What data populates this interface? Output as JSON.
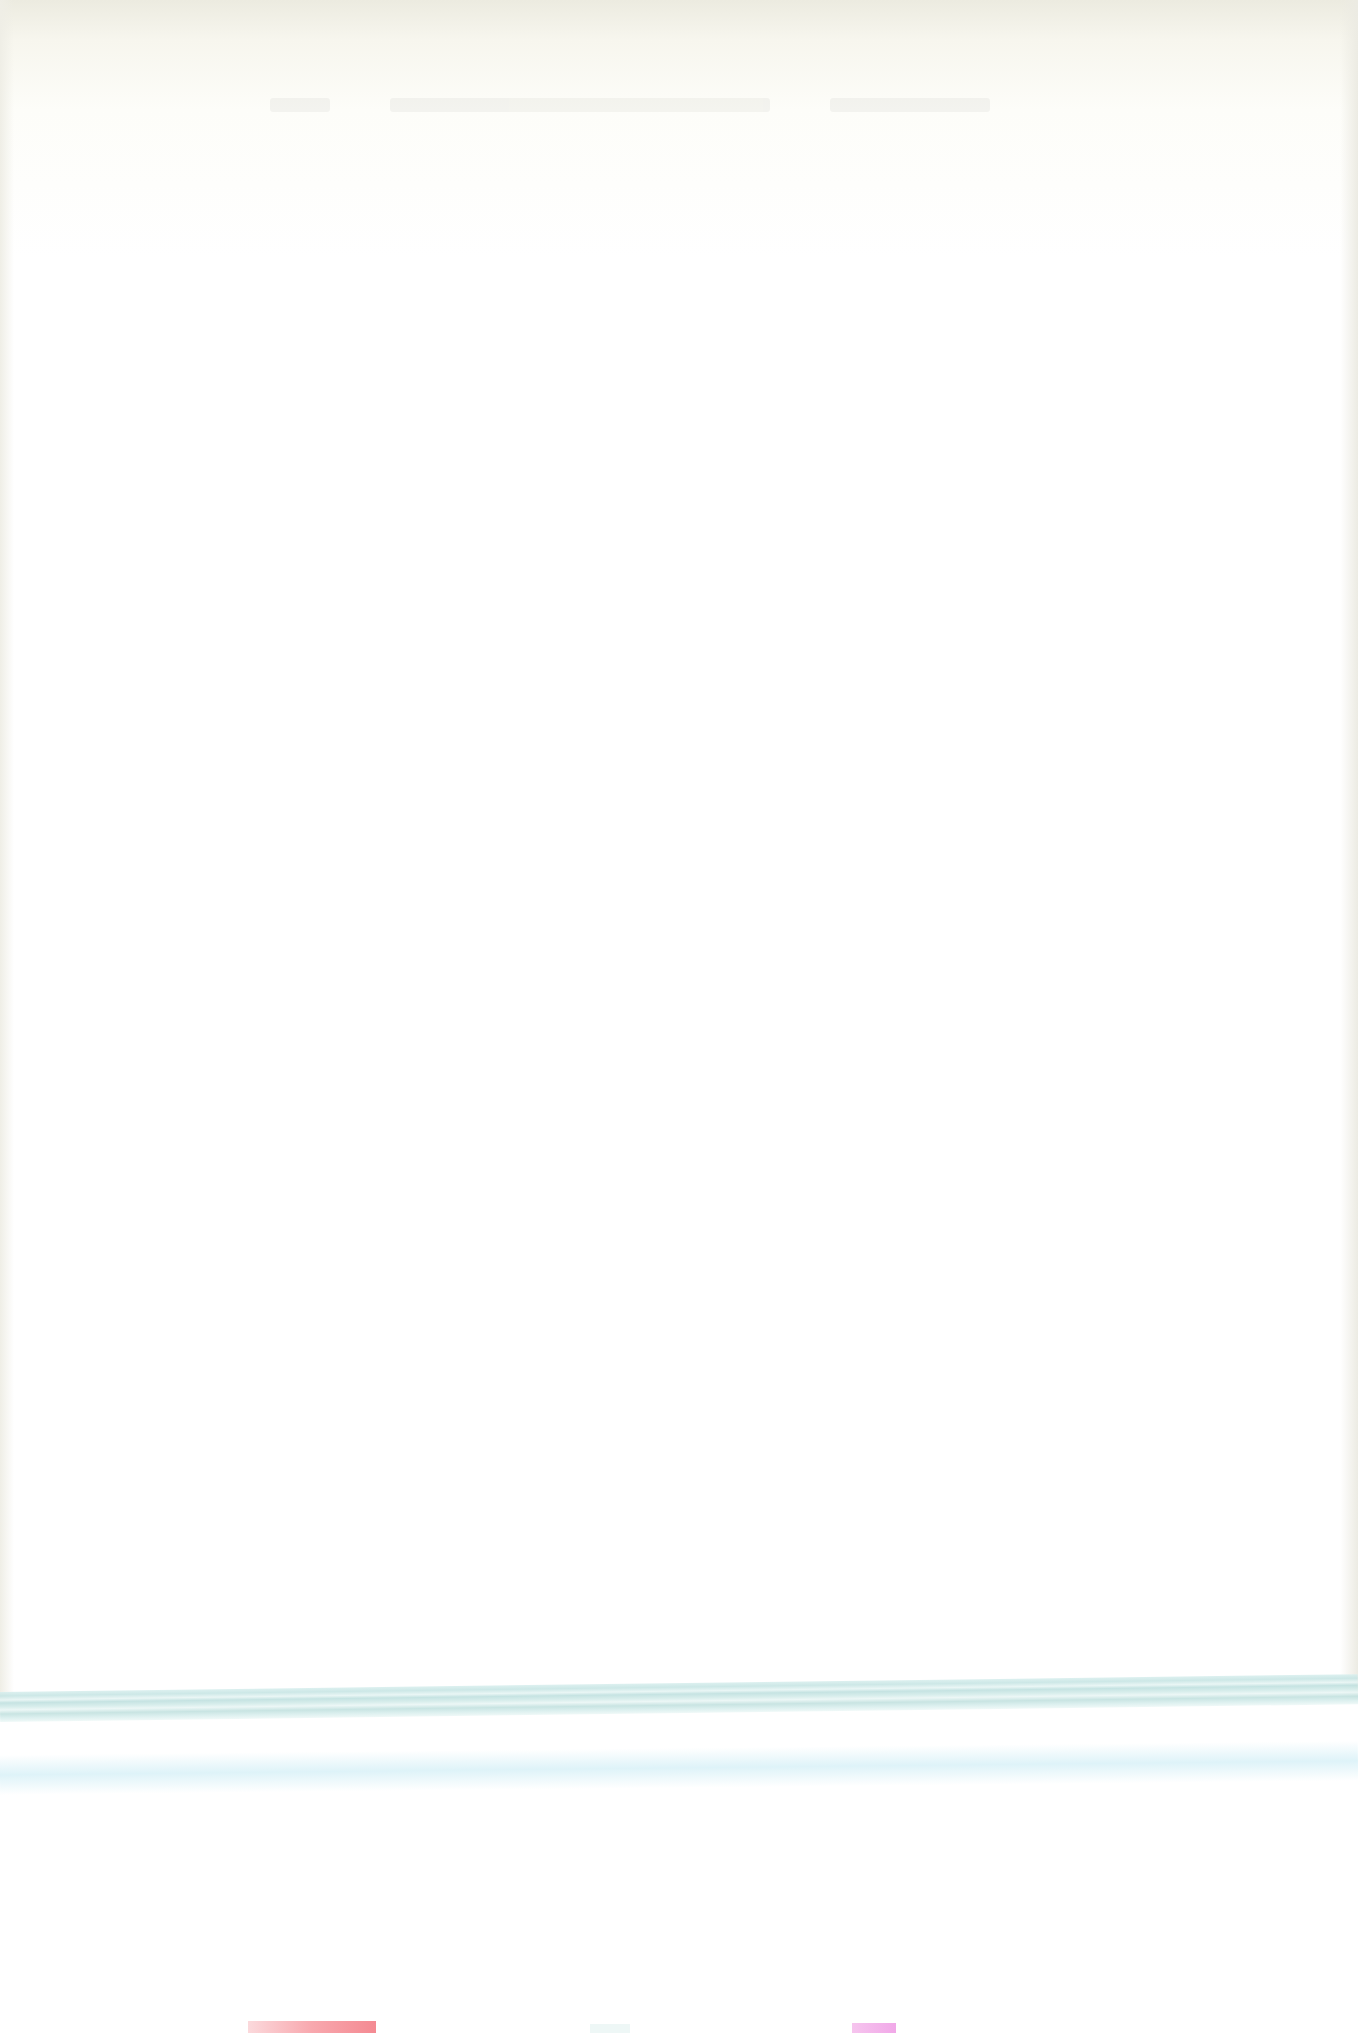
{
  "page": {
    "type": "scanned-blank-page",
    "header_text_legible": false,
    "body_text": ""
  },
  "colors": {
    "paper": "#fefefd",
    "top_shading": "#ecebe0",
    "teal_band": "#c7e5e4",
    "bottom_red_block": "#f48a92",
    "bottom_pink_block": "#f1a8e8"
  }
}
